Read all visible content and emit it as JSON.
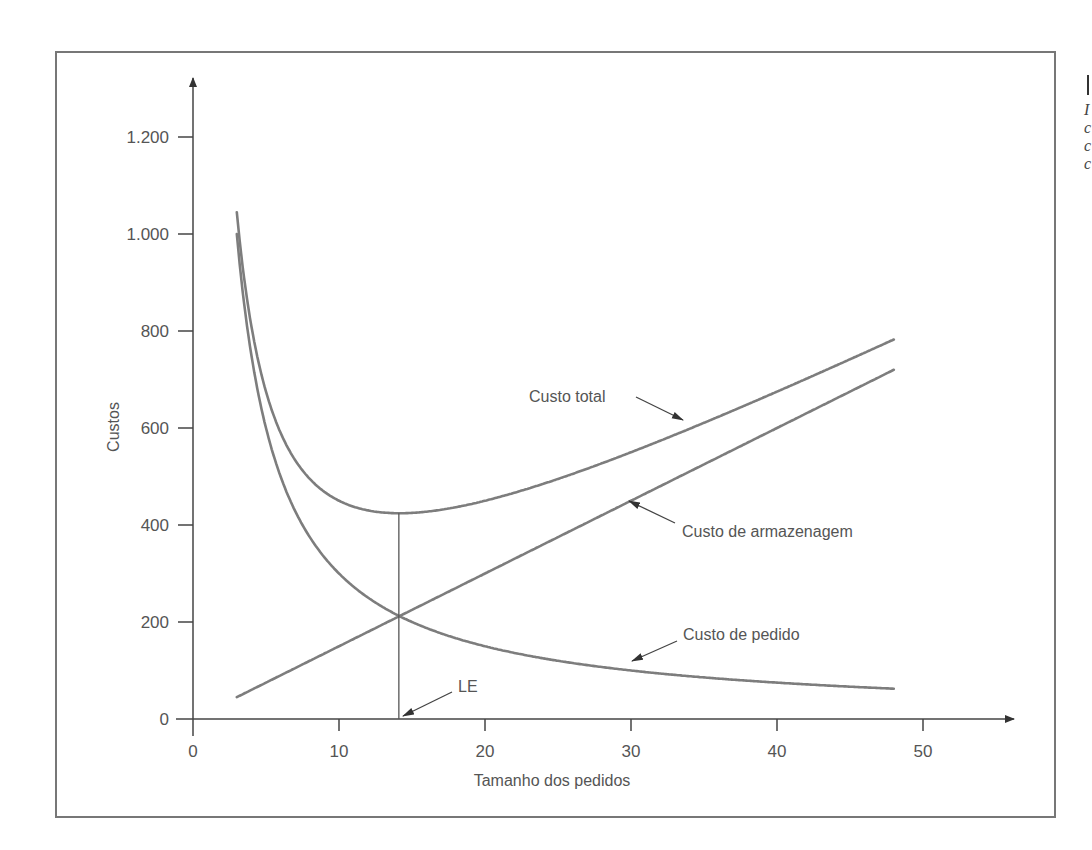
{
  "chart_data": {
    "type": "line",
    "title": "",
    "xlabel": "Tamanho dos pedidos",
    "ylabel": "Custos",
    "xlim": [
      0,
      55
    ],
    "ylim": [
      0,
      1300
    ],
    "x_ticks": [
      0,
      10,
      20,
      30,
      40,
      50
    ],
    "x_tick_labels": [
      "0",
      "10",
      "20",
      "30",
      "40",
      "50"
    ],
    "y_ticks": [
      0,
      200,
      400,
      600,
      800,
      1000,
      1200
    ],
    "y_tick_labels": [
      "0",
      "200",
      "400",
      "600",
      "800",
      "1.000",
      "1.200"
    ],
    "grid": false,
    "legend": "none (curves labeled by inline annotations)",
    "x_range_of_curves": [
      3,
      48
    ],
    "series": [
      {
        "name": "Custo total",
        "x": [
          3,
          4,
          5,
          6,
          8,
          10,
          12,
          14.14,
          16,
          20,
          25,
          30,
          35,
          40,
          45,
          48
        ],
        "values": [
          1045,
          810,
          675,
          590,
          495,
          450,
          430,
          424,
          428,
          450,
          495,
          550,
          611,
          675,
          742,
          782
        ]
      },
      {
        "name": "Custo de armazenagem",
        "x": [
          3,
          14.14,
          48
        ],
        "values": [
          45,
          212,
          720
        ]
      },
      {
        "name": "Custo de pedido",
        "x": [
          3,
          4,
          5,
          6,
          8,
          10,
          12,
          14.14,
          16,
          20,
          25,
          30,
          35,
          40,
          45,
          48
        ],
        "values": [
          1000,
          750,
          600,
          500,
          375,
          300,
          250,
          212,
          188,
          150,
          120,
          100,
          86,
          75,
          67,
          62.5
        ]
      }
    ],
    "annotations": [
      {
        "text": "Custo total",
        "points_to": "Custo total curve near x≈33"
      },
      {
        "text": "Custo de armazenagem",
        "points_to": "Custo de armazenagem line near x≈31"
      },
      {
        "text": "Custo de pedido",
        "points_to": "Custo de pedido curve near x≈30"
      },
      {
        "text": "LE",
        "points_to": "x-axis at economic order quantity x≈14.1 (vertical line from total-cost minimum ≈424 down through intersection ≈212)"
      }
    ],
    "economic_lot": {
      "label": "LE",
      "x": 14.1,
      "total_cost_min": 424,
      "intersection_cost": 212
    }
  },
  "labels": {
    "ylabel": "Custos",
    "xlabel": "Tamanho dos pedidos",
    "total": "Custo total",
    "storage": "Custo de armazenagem",
    "order": "Custo de pedido",
    "le": "LE"
  },
  "colors": {
    "curve": "#7d7d7d",
    "axis": "#444444",
    "text": "#555555",
    "frame": "#777777"
  }
}
